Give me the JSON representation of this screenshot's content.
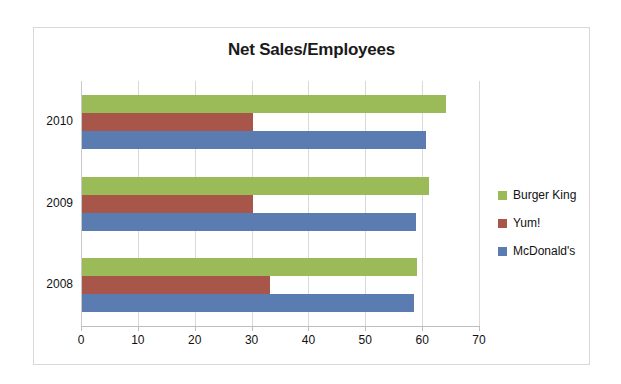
{
  "chart_data": {
    "type": "bar",
    "orientation": "horizontal",
    "title": "Net Sales/Employees",
    "xlabel": "",
    "ylabel": "",
    "categories": [
      "2010",
      "2009",
      "2008"
    ],
    "series": [
      {
        "name": "Burger King",
        "color": "#9bbb59",
        "values": [
          64,
          61,
          59
        ]
      },
      {
        "name": "Yum!",
        "color": "#a8564a",
        "values": [
          30,
          30,
          33
        ]
      },
      {
        "name": "McDonald's",
        "color": "#5b7cb1",
        "values": [
          60.5,
          58.8,
          58.4
        ]
      }
    ],
    "xlim": [
      0,
      70
    ],
    "xticks": [
      "0",
      "10",
      "20",
      "30",
      "40",
      "50",
      "60",
      "70"
    ],
    "xtick_values": [
      0,
      10,
      20,
      30,
      40,
      50,
      60,
      70
    ],
    "grid": true,
    "legend_position": "right"
  },
  "legend": {
    "items": [
      {
        "label": "Burger King",
        "color": "#9bbb59"
      },
      {
        "label": "Yum!",
        "color": "#a8564a"
      },
      {
        "label": "McDonald's",
        "color": "#5b7cb1"
      }
    ]
  },
  "frame": {
    "border_color": "#d8d8d8",
    "background": "#ffffff"
  }
}
